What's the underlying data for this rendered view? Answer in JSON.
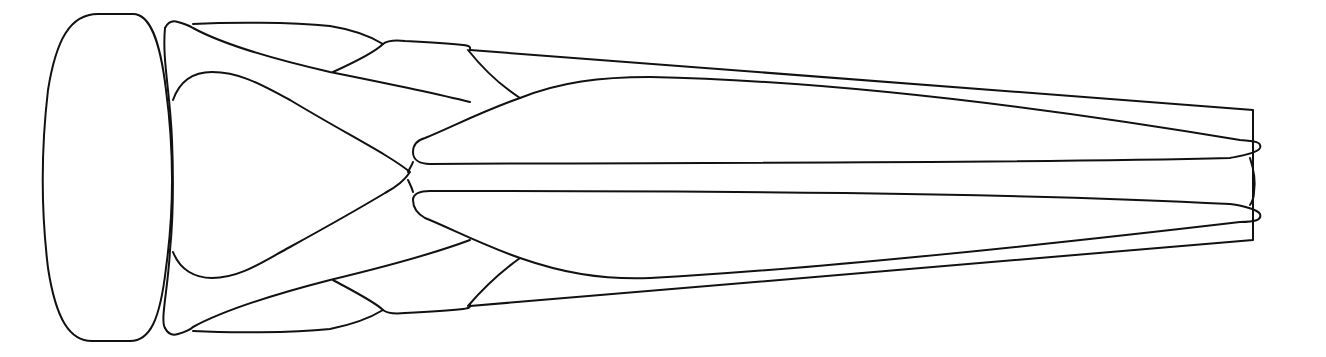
{
  "diagram": {
    "title": "Dorsal outline drawing",
    "background": "#ffffff",
    "stroke_color": "#111111",
    "parts": [
      {
        "name": "head"
      },
      {
        "name": "pronotum"
      },
      {
        "name": "scutellum-left-plate"
      },
      {
        "name": "scutellum-right-plate"
      },
      {
        "name": "forewing-left"
      },
      {
        "name": "forewing-right"
      },
      {
        "name": "abdomen-box"
      },
      {
        "name": "tip-appendages"
      }
    ]
  }
}
